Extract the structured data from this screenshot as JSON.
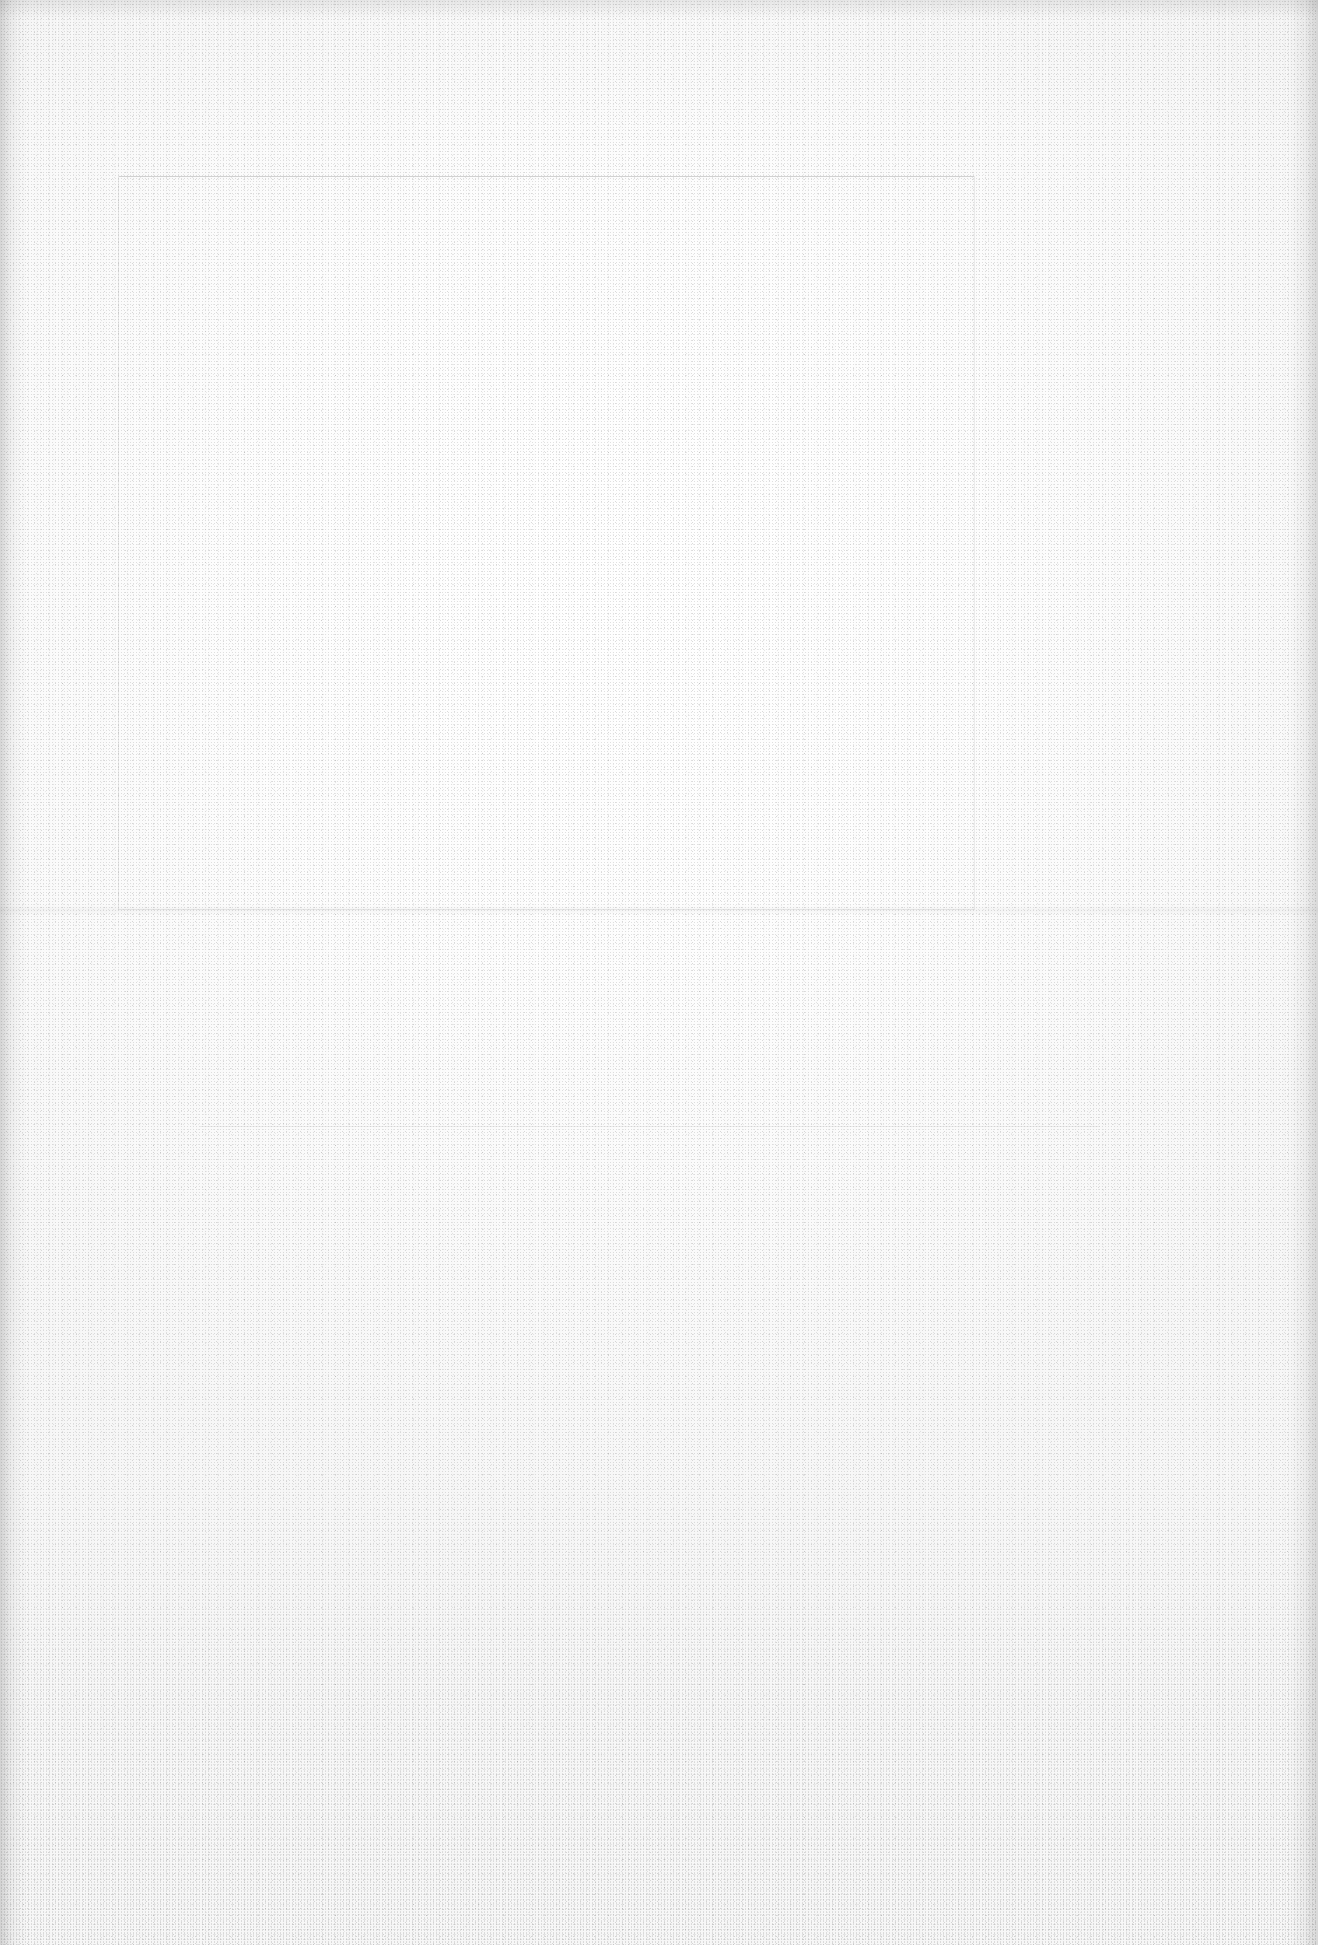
{
  "page": {
    "kind": "blank-scanned-page",
    "width": 1318,
    "height": 1945,
    "orientation": "portrait"
  },
  "appearance": {
    "paper_color": "#FAFAFA",
    "highlight_color": "#FFFFFF",
    "shadow_color": "#F5F5F5",
    "grain_color": "#C9C9C9",
    "edge_shadow_color": "#9E9E9E",
    "ghost_line_color": "#8C8C8C"
  },
  "artifacts": {
    "items": [
      {
        "name": "scanner-streaks-top",
        "note": "vertical streaking band along the top edge"
      },
      {
        "name": "edge-shading-left",
        "note": "darker vertical band at the left margin"
      },
      {
        "name": "edge-shading-right",
        "note": "darker vertical band at the right margin"
      },
      {
        "name": "paper-grain",
        "note": "fine speckled grain across the whole sheet"
      },
      {
        "name": "ghost-frame",
        "note": "extremely faint rectangular outline, upper two thirds"
      },
      {
        "name": "ghost-rule",
        "note": "extremely faint horizontal rule in the lower third"
      }
    ]
  },
  "text": {
    "content": "",
    "note": "No legible text is present anywhere on the page"
  }
}
